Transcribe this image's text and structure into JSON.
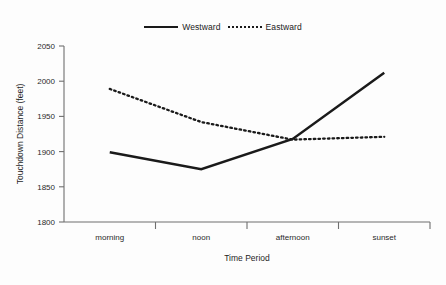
{
  "chart_data": {
    "type": "line",
    "title": "",
    "categories": [
      "morning",
      "noon",
      "afternoon",
      "sunset"
    ],
    "series": [
      {
        "name": "Westward",
        "style": "solid",
        "values": [
          1899,
          1875,
          1918,
          2012
        ]
      },
      {
        "name": "Eastward",
        "style": "dotted",
        "values": [
          1989,
          1942,
          1917,
          1921
        ]
      }
    ],
    "xlabel": "Time Period",
    "ylabel": "Touchdown Distance (feet)",
    "ylim": [
      1800,
      2050
    ],
    "yticks": [
      1800,
      1850,
      1900,
      1950,
      2000,
      2050
    ],
    "ytick_labels": [
      "1800",
      "1850",
      "1900",
      "1950",
      "2000",
      "2050"
    ],
    "grid": false,
    "legend_position": "top-center",
    "line_color": "#1a1a1a",
    "axis_color": "#6f6f6f"
  },
  "legend": {
    "entries": [
      {
        "label": "Westward"
      },
      {
        "label": "Eastward"
      }
    ]
  },
  "axes": {
    "y_title": "Touchdown Distance (feet)",
    "x_title": "Time Period",
    "y_tick_0": "1800",
    "y_tick_1": "1850",
    "y_tick_2": "1900",
    "y_tick_3": "1950",
    "y_tick_4": "2000",
    "y_tick_5": "2050",
    "x_tick_0": "morning",
    "x_tick_1": "noon",
    "x_tick_2": "afternoon",
    "x_tick_3": "sunset"
  }
}
